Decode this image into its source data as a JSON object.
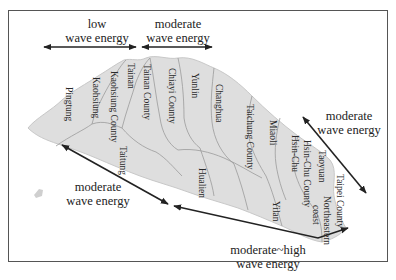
{
  "figure": {
    "type": "wave energy map of Taiwan coastline (rotated)",
    "colors": {
      "land": "#dedede",
      "border": "#9a9a9a",
      "arrow": "#222222",
      "frame": "#555555"
    }
  },
  "zones": [
    {
      "id": "low",
      "line1": "low",
      "line2": "wave energy"
    },
    {
      "id": "moderate-west",
      "line1": "moderate",
      "line2": "wave energy"
    },
    {
      "id": "moderate-north",
      "line1": "moderate",
      "line2": "wave energy"
    },
    {
      "id": "moderate-east",
      "line1": "moderate",
      "line2": "wave energy"
    },
    {
      "id": "moderate-high",
      "line1": "moderate~high",
      "line2": "wave energy"
    }
  ],
  "places": [
    "Pingtung",
    "Kaohsiung",
    "Kaohsiung County",
    "Tainan",
    "Tainan County",
    "Chiayi County",
    "Yunlin",
    "Changhua",
    "Taichung County",
    "Miaoli",
    "Hsin-Chu",
    "Hsin-Chu County",
    "Taoyuan",
    "Taipei County",
    "Northeastern",
    "coast",
    "Taitung",
    "Hualien",
    "Yilan"
  ]
}
